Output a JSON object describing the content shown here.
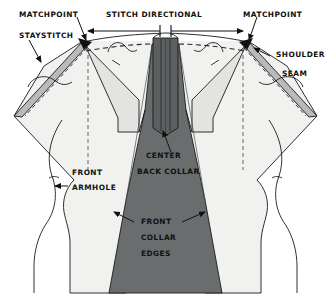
{
  "diagram": {
    "type": "sewing-pattern-illustration",
    "background_color": "#ffffff",
    "colors": {
      "collar_fill": "#6a6d6e",
      "body_fill": "#f1f1ef",
      "shoulder_band_fill": "#b9bbbb",
      "facing_fill": "#e3e3e1",
      "outline": "#1a1a1a",
      "stitch_dash": "#2b2b2b",
      "label_text": "#111111"
    },
    "labels": {
      "matchpoint_left": "MATCHPOINT",
      "matchpoint_right": "MATCHPOINT",
      "staystitch": "STAYSTITCH",
      "stitch_directional": "STITCH DIRECTIONAL",
      "shoulder_seam_line1": "SHOULDER",
      "shoulder_seam_line2": "SEAM",
      "center_back_collar_line1": "CENTER",
      "center_back_collar_line2": "BACK COLLAR",
      "front_armhole_line1": "FRONT",
      "front_armhole_line2": "ARMHOLE",
      "front_collar_edges_line1": "FRONT",
      "front_collar_edges_line2": "COLLAR",
      "front_collar_edges_line3": "EDGES"
    },
    "annotations": [
      {
        "name": "matchpoint-left",
        "text": "MATCHPOINT",
        "points_to": "left shoulder matchpoint dot"
      },
      {
        "name": "staystitch",
        "text": "STAYSTITCH",
        "points_to": "left neckline staystitch line"
      },
      {
        "name": "stitch-directional",
        "text": "STITCH DIRECTIONAL",
        "points_to": "center back, arrows outward both ways"
      },
      {
        "name": "matchpoint-right",
        "text": "MATCHPOINT",
        "points_to": "right shoulder matchpoint dot"
      },
      {
        "name": "shoulder-seam",
        "text": "SHOULDER SEAM",
        "points_to": "right shoulder seam band"
      },
      {
        "name": "center-back-collar",
        "text": "CENTER BACK COLLAR",
        "points_to": "center back collar notch"
      },
      {
        "name": "front-armhole",
        "text": "FRONT ARMHOLE",
        "points_to": "left front armhole curve"
      },
      {
        "name": "front-collar-edges",
        "text": "FRONT COLLAR EDGES",
        "points_to": "both front collar edges"
      }
    ]
  }
}
